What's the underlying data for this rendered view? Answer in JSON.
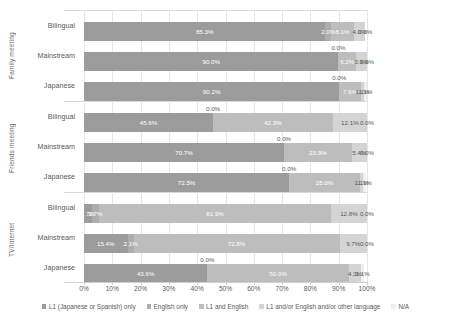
{
  "chart_data": {
    "type": "bar",
    "orientation": "horizontal",
    "stacked": true,
    "stack_mode": "percent",
    "title": "",
    "xlabel": "",
    "ylabel": "",
    "xlim": [
      0,
      100
    ],
    "grid": true,
    "legend_position": "bottom",
    "xticks": [
      "0%",
      "10%",
      "20%",
      "30%",
      "40%",
      "50%",
      "60%",
      "70%",
      "80%",
      "90%",
      "100%"
    ],
    "xtick_values": [
      0,
      10,
      20,
      30,
      40,
      50,
      60,
      70,
      80,
      90,
      100
    ],
    "series": [
      {
        "name": "L1 (Japanese or Spanish) only",
        "color": "#9c9c9c"
      },
      {
        "name": "English only",
        "color": "#adadad"
      },
      {
        "name": "L1 and English",
        "color": "#bdbdbd"
      },
      {
        "name": "L1 and/or English and/or other language",
        "color": "#d4d4d4"
      },
      {
        "name": "N/A",
        "color": "#efefef"
      }
    ],
    "groups": [
      {
        "name": "Family meeting",
        "rows": [
          {
            "label": "Bilingual",
            "values": [
              85.3,
              2.0,
              8.1,
              4.0,
              0.0
            ],
            "labels": [
              "85.3%",
              "2.0%",
              "8.1%",
              "4.0%",
              "0.0%"
            ]
          },
          {
            "label": "Mainstream",
            "values": [
              90.0,
              0.0,
              6.2,
              3.9,
              0.0
            ],
            "labels": [
              "90.0%",
              "0.0%",
              "6.2%",
              "3.9%",
              "0.0%"
            ]
          },
          {
            "label": "Japanese",
            "values": [
              90.2,
              0.0,
              7.6,
              1.1,
              1.1
            ],
            "labels": [
              "90.2%",
              "0.0%",
              "7.6%",
              "1.1%",
              "1.1%"
            ]
          }
        ]
      },
      {
        "name": "Friends meeting",
        "rows": [
          {
            "label": "Bilingual",
            "values": [
              45.6,
              0.0,
              42.3,
              12.1,
              0.0
            ],
            "labels": [
              "45.6%",
              "0.0%",
              "42.3%",
              "12.1%",
              "0.0%"
            ]
          },
          {
            "label": "Mainstream",
            "values": [
              70.7,
              0.0,
              23.9,
              5.4,
              0.0
            ],
            "labels": [
              "70.7%",
              "0.0%",
              "23.9%",
              "5.4%",
              "0.0%"
            ]
          },
          {
            "label": "Japanese",
            "values": [
              72.5,
              0.0,
              25.0,
              1.1,
              1.1
            ],
            "labels": [
              "72.5%",
              "0.0%",
              "25.0%",
              "1.1%",
              "1.1%"
            ]
          }
        ]
      },
      {
        "name": "TV/Internet",
        "rows": [
          {
            "label": "Bilingual",
            "values": [
              2.7,
              2.7,
              81.9,
              12.8,
              0.0
            ],
            "labels": [
              "2.7%",
              "2.7%",
              "81.9%",
              "12.8%",
              "0.0%"
            ]
          },
          {
            "label": "Mainstream",
            "values": [
              15.4,
              2.1,
              72.8,
              9.7,
              0.0
            ],
            "labels": [
              "15.4%",
              "2.1%",
              "72.8%",
              "9.7%",
              "0.0%"
            ]
          },
          {
            "label": "Japanese",
            "values": [
              43.6,
              0.0,
              50.0,
              4.3,
              1.1
            ],
            "labels": [
              "43.6%",
              "0.0%",
              "50.0%",
              "4.3%",
              "1.1%"
            ]
          }
        ]
      }
    ]
  }
}
